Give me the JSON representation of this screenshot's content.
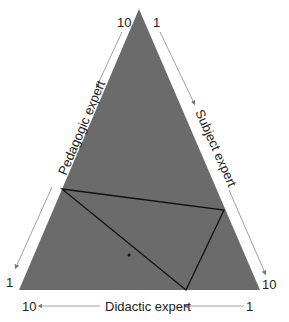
{
  "diagram": {
    "type": "ternary",
    "colors": {
      "fill": "#6b6b6b",
      "inner_line": "#111111",
      "arrow": "#888888",
      "text": "#222222"
    },
    "axes": {
      "left": {
        "label": "Pedagogic expert",
        "start": "10",
        "end": "1"
      },
      "right": {
        "label": "Subject expert",
        "start": "1",
        "end": "10"
      },
      "bottom": {
        "label": "Didactic expert",
        "start": "1",
        "end": "10"
      }
    },
    "inner_triangle": "three vertices touching each side of the outer triangle",
    "point": "single dot inside lower-left region"
  }
}
